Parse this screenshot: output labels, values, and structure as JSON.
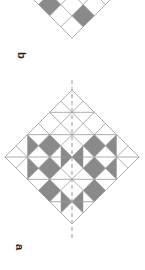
{
  "figure": {
    "panels": [
      {
        "label": "b",
        "description": "partial diamond grid pattern with shaded squares"
      },
      {
        "label": "a",
        "description": "diamond grid pattern with shaded squares and triangles, dashed symmetry axis"
      }
    ],
    "colors": {
      "shade": "#8a8a8a",
      "line": "#9a9a9a",
      "background": "#ffffff"
    }
  }
}
